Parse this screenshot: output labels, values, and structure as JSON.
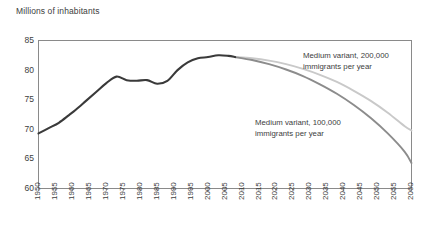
{
  "chart_data": {
    "type": "line",
    "title": "",
    "ylabel": "Millions of inhabitants",
    "xlabel": "",
    "ylim": [
      60,
      85
    ],
    "yticks": [
      60,
      65,
      70,
      75,
      80,
      85
    ],
    "xlim": [
      1950,
      2060
    ],
    "xticks": [
      1950,
      1955,
      1960,
      1965,
      1970,
      1975,
      1980,
      1985,
      1990,
      1995,
      2000,
      2005,
      2010,
      2015,
      2020,
      2025,
      2030,
      2035,
      2040,
      2045,
      2050,
      2055,
      2060
    ],
    "grid": false,
    "legend_position": "inline-annotations",
    "series": [
      {
        "name": "Historical population",
        "color": "#3a3a3a",
        "x": [
          1950,
          1953,
          1956,
          1959,
          1961,
          1964,
          1967,
          1970,
          1973,
          1976,
          1979,
          1982,
          1985,
          1988,
          1991,
          1994,
          1997,
          2000,
          2003,
          2006,
          2008
        ],
        "values": [
          69.3,
          70.2,
          71.1,
          72.4,
          73.3,
          74.8,
          76.3,
          77.8,
          78.9,
          78.3,
          78.2,
          78.3,
          77.7,
          78.2,
          80.0,
          81.3,
          82.0,
          82.2,
          82.5,
          82.4,
          82.2
        ]
      },
      {
        "name": "Medium variant, 200,000 immigrants per year",
        "color": "#c9c9c9",
        "x": [
          2008,
          2013,
          2018,
          2023,
          2028,
          2033,
          2038,
          2043,
          2048,
          2053,
          2058,
          2060
        ],
        "values": [
          82.2,
          82.0,
          81.6,
          81.0,
          80.2,
          79.2,
          78.0,
          76.5,
          74.8,
          72.8,
          70.5,
          69.8
        ]
      },
      {
        "name": "Medium variant, 100,000 immigrants per year",
        "color": "#8c8c8c",
        "x": [
          2008,
          2013,
          2018,
          2023,
          2028,
          2033,
          2038,
          2043,
          2048,
          2053,
          2058,
          2060
        ],
        "values": [
          82.2,
          81.7,
          81.0,
          80.1,
          79.0,
          77.6,
          76.0,
          74.1,
          71.9,
          69.3,
          66.2,
          64.3
        ]
      }
    ],
    "annotations": [
      {
        "id": "annot-200",
        "text": "Medium variant, 200,000\nimmigrants per year"
      },
      {
        "id": "annot-100",
        "text": "Medium variant, 100,000\nimmigrants per year"
      }
    ],
    "colors": {
      "historical": "#3a3a3a",
      "variant_200k": "#c9c9c9",
      "variant_100k": "#8c8c8c",
      "axis": "#808080",
      "text": "#3d3d3d"
    }
  }
}
